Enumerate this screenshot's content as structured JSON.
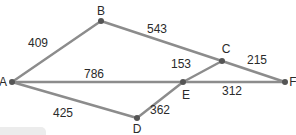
{
  "diagram": {
    "type": "weighted-graph",
    "nodes": [
      {
        "id": "A",
        "label": "A",
        "x": 12,
        "y": 82,
        "lx": 3,
        "ly": 86
      },
      {
        "id": "B",
        "label": "B",
        "x": 101,
        "y": 21,
        "lx": 101,
        "ly": 15
      },
      {
        "id": "C",
        "label": "C",
        "x": 222,
        "y": 61,
        "lx": 226,
        "ly": 53
      },
      {
        "id": "D",
        "label": "D",
        "x": 137,
        "y": 118,
        "lx": 137,
        "ly": 133
      },
      {
        "id": "E",
        "label": "E",
        "x": 183,
        "y": 82,
        "lx": 186,
        "ly": 99
      },
      {
        "id": "F",
        "label": "F",
        "x": 285,
        "y": 82,
        "lx": 293,
        "ly": 86
      }
    ],
    "edges": [
      {
        "from": "A",
        "to": "B",
        "weight": "409",
        "wx": 38,
        "wy": 47
      },
      {
        "from": "B",
        "to": "C",
        "weight": "543",
        "wx": 157,
        "wy": 33
      },
      {
        "from": "A",
        "to": "E",
        "weight": "786",
        "wx": 94,
        "wy": 78
      },
      {
        "from": "E",
        "to": "C",
        "weight": "153",
        "wx": 181,
        "wy": 68
      },
      {
        "from": "C",
        "to": "F",
        "weight": "215",
        "wx": 257,
        "wy": 64
      },
      {
        "from": "E",
        "to": "F",
        "weight": "312",
        "wx": 232,
        "wy": 95
      },
      {
        "from": "A",
        "to": "D",
        "weight": "425",
        "wx": 63,
        "wy": 117
      },
      {
        "from": "D",
        "to": "E",
        "weight": "362",
        "wx": 160,
        "wy": 114
      }
    ],
    "colors": {
      "edge": "#8c8c8c",
      "node": "#555555",
      "text": "#2a2a2a"
    }
  }
}
